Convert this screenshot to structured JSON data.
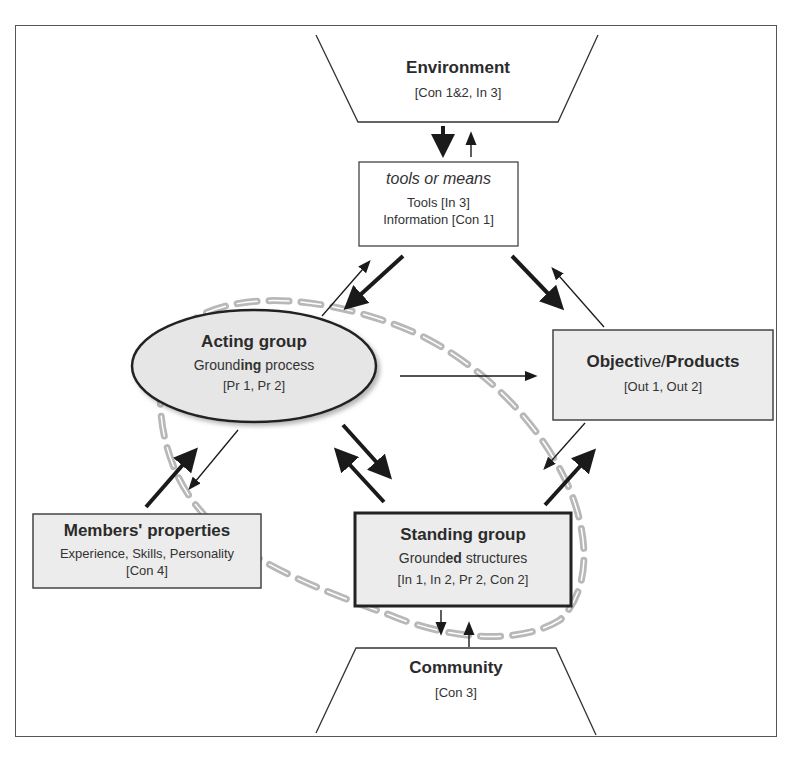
{
  "caption": "",
  "nodes": {
    "environment": {
      "title": "Environment",
      "refs": "[Con 1&2, In 3]"
    },
    "tools": {
      "title": "tools or means",
      "line1": "Tools [In 3]",
      "line2": "Information [Con 1]"
    },
    "acting_group": {
      "title": "Acting group",
      "sub_prefix": "Ground",
      "sub_bold": "ing",
      "sub_suffix": " process",
      "refs": "[Pr 1, Pr 2]"
    },
    "objective": {
      "title_bold1": "Object",
      "title_normal": "ive/",
      "title_bold2": "Products",
      "refs": "[Out 1, Out 2]"
    },
    "members": {
      "title": "Members' properties",
      "line1": "Experience, Skills, Personality",
      "refs": "[Con 4]"
    },
    "standing_group": {
      "title": "Standing group",
      "sub_prefix": "Ground",
      "sub_bold": "ed",
      "sub_suffix": " structures",
      "refs": "[In 1, In 2, Pr 2, Con 2]"
    },
    "community": {
      "title": "Community",
      "refs": "[Con 3]"
    }
  },
  "colors": {
    "box_fill": "#ececec",
    "ellipse_fill": "#e6e6e6",
    "dashed_outline": "#b5b5b5",
    "stroke": "#222222"
  }
}
